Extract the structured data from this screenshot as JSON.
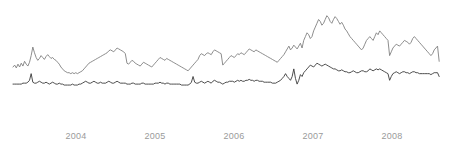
{
  "chart_data": {
    "type": "line",
    "title": "",
    "subtitle": "",
    "xlabel": "",
    "ylabel": "",
    "grid": false,
    "legend": "none",
    "axis_visible": false,
    "xlim": [
      2003.45,
      2008.62
    ],
    "ylim": [
      0,
      100
    ],
    "tick_labels": [
      "2004",
      "2005",
      "2006",
      "2007",
      "2008"
    ],
    "tick_values": [
      2004,
      2005,
      2006,
      2007,
      2008
    ],
    "tick_color": "#9a9a9a",
    "series": [
      {
        "name": "upper-series",
        "color": "#808080",
        "stroke_width": 0.9,
        "x": [
          2003.45,
          2003.47,
          2003.49,
          2003.51,
          2003.53,
          2003.55,
          2003.57,
          2003.59,
          2003.61,
          2003.63,
          2003.65,
          2003.67,
          2003.69,
          2003.71,
          2003.73,
          2003.75,
          2003.77,
          2003.79,
          2003.81,
          2003.83,
          2003.85,
          2003.87,
          2003.89,
          2003.91,
          2003.93,
          2003.95,
          2003.97,
          2003.99,
          2004.01,
          2004.03,
          2004.05,
          2004.07,
          2004.09,
          2004.11,
          2004.13,
          2004.15,
          2004.17,
          2004.19,
          2004.21,
          2004.23,
          2004.25,
          2004.27,
          2004.29,
          2004.31,
          2004.33,
          2004.35,
          2004.37,
          2004.39,
          2004.41,
          2004.43,
          2004.45,
          2004.47,
          2004.49,
          2004.51,
          2004.53,
          2004.55,
          2004.57,
          2004.59,
          2004.61,
          2004.63,
          2004.65,
          2004.67,
          2004.69,
          2004.71,
          2004.73,
          2004.75,
          2004.77,
          2004.79,
          2004.81,
          2004.83,
          2004.85,
          2004.87,
          2004.89,
          2004.91,
          2004.93,
          2004.95,
          2004.97,
          2004.99,
          2005.01,
          2005.03,
          2005.05,
          2005.07,
          2005.09,
          2005.11,
          2005.13,
          2005.15,
          2005.17,
          2005.19,
          2005.21,
          2005.23,
          2005.25,
          2005.27,
          2005.29,
          2005.31,
          2005.33,
          2005.35,
          2005.37,
          2005.39,
          2005.41,
          2005.43,
          2005.45,
          2005.47,
          2005.49,
          2005.51,
          2005.53,
          2005.55,
          2005.57,
          2005.59,
          2005.61,
          2005.63,
          2005.65,
          2005.67,
          2005.69,
          2005.71,
          2005.73,
          2005.75,
          2005.77,
          2005.79,
          2005.81,
          2005.83,
          2005.85,
          2005.87,
          2005.89,
          2005.91,
          2005.93,
          2005.95,
          2005.97,
          2005.99,
          2006.01,
          2006.03,
          2006.05,
          2006.07,
          2006.09,
          2006.11,
          2006.13,
          2006.15,
          2006.17,
          2006.19,
          2006.21,
          2006.23,
          2006.25,
          2006.27,
          2006.29,
          2006.31,
          2006.33,
          2006.35,
          2006.37,
          2006.39,
          2006.41,
          2006.43,
          2006.45,
          2006.47,
          2006.49,
          2006.51,
          2006.53,
          2006.55,
          2006.57,
          2006.59,
          2006.61,
          2006.63,
          2006.65,
          2006.67,
          2006.69,
          2006.71,
          2006.73,
          2006.75,
          2006.77,
          2006.79,
          2006.81,
          2006.83,
          2006.85,
          2006.87,
          2006.89,
          2006.91,
          2006.93,
          2006.95,
          2006.97,
          2006.99,
          2007.01,
          2007.03,
          2007.05,
          2007.07,
          2007.09,
          2007.11,
          2007.13,
          2007.15,
          2007.17,
          2007.19,
          2007.21,
          2007.23,
          2007.25,
          2007.27,
          2007.29,
          2007.31,
          2007.33,
          2007.35,
          2007.37,
          2007.39,
          2007.41,
          2007.43,
          2007.45,
          2007.47,
          2007.49,
          2007.51,
          2007.53,
          2007.55,
          2007.57,
          2007.59,
          2007.61,
          2007.63,
          2007.65,
          2007.67,
          2007.69,
          2007.71,
          2007.73,
          2007.75,
          2007.77,
          2007.79,
          2007.81,
          2007.83,
          2007.85,
          2007.87,
          2007.89,
          2007.91,
          2007.93,
          2007.95,
          2007.97,
          2007.99,
          2008.01,
          2008.03,
          2008.05,
          2008.07,
          2008.09,
          2008.11,
          2008.13,
          2008.15,
          2008.17,
          2008.19,
          2008.21,
          2008.23,
          2008.25,
          2008.27,
          2008.29,
          2008.31,
          2008.33,
          2008.35,
          2008.37,
          2008.39,
          2008.41,
          2008.43,
          2008.45,
          2008.47,
          2008.49,
          2008.51,
          2008.53,
          2008.55,
          2008.57,
          2008.59,
          2008.61
        ],
        "values": [
          40,
          42,
          39,
          43,
          40,
          44,
          41,
          46,
          43,
          41,
          45,
          52,
          61,
          55,
          50,
          47,
          49,
          52,
          50,
          48,
          51,
          53,
          51,
          49,
          50,
          48,
          47,
          45,
          43,
          40,
          38,
          36,
          35,
          34,
          34,
          33,
          34,
          33,
          34,
          33,
          34,
          35,
          36,
          38,
          40,
          42,
          44,
          45,
          46,
          47,
          48,
          49,
          50,
          51,
          52,
          53,
          54,
          55,
          57,
          58,
          57,
          56,
          58,
          60,
          59,
          58,
          57,
          56,
          54,
          44,
          43,
          45,
          47,
          46,
          44,
          43,
          42,
          41,
          43,
          45,
          44,
          43,
          42,
          41,
          40,
          42,
          44,
          46,
          48,
          50,
          49,
          48,
          47,
          49,
          48,
          47,
          46,
          45,
          44,
          43,
          42,
          41,
          40,
          39,
          38,
          37,
          36,
          38,
          40,
          42,
          44,
          46,
          48,
          52,
          54,
          53,
          52,
          54,
          55,
          54,
          53,
          56,
          58,
          57,
          56,
          55,
          54,
          42,
          44,
          46,
          48,
          50,
          52,
          51,
          50,
          52,
          54,
          53,
          55,
          54,
          53,
          55,
          57,
          59,
          58,
          57,
          56,
          58,
          57,
          56,
          55,
          54,
          53,
          52,
          51,
          50,
          49,
          48,
          47,
          46,
          45,
          47,
          49,
          51,
          53,
          56,
          59,
          62,
          58,
          60,
          63,
          61,
          59,
          62,
          65,
          60,
          68,
          72,
          76,
          74,
          70,
          72,
          78,
          82,
          86,
          90,
          88,
          84,
          86,
          90,
          94,
          92,
          88,
          86,
          90,
          93,
          91,
          88,
          85,
          87,
          84,
          80,
          78,
          75,
          72,
          70,
          68,
          66,
          64,
          62,
          60,
          58,
          60,
          64,
          68,
          70,
          72,
          70,
          68,
          72,
          76,
          74,
          78,
          76,
          74,
          72,
          70,
          68,
          52,
          56,
          60,
          62,
          64,
          63,
          62,
          64,
          66,
          68,
          67,
          66,
          64,
          66,
          70,
          72,
          70,
          68,
          66,
          64,
          62,
          60,
          58,
          56,
          54,
          52,
          54,
          58,
          60,
          62,
          46
        ]
      },
      {
        "name": "lower-series",
        "color": "#3a3a3a",
        "stroke_width": 0.9,
        "x": [
          2003.45,
          2003.47,
          2003.49,
          2003.51,
          2003.53,
          2003.55,
          2003.57,
          2003.59,
          2003.61,
          2003.63,
          2003.65,
          2003.67,
          2003.69,
          2003.71,
          2003.73,
          2003.75,
          2003.77,
          2003.79,
          2003.81,
          2003.83,
          2003.85,
          2003.87,
          2003.89,
          2003.91,
          2003.93,
          2003.95,
          2003.97,
          2003.99,
          2004.01,
          2004.03,
          2004.05,
          2004.07,
          2004.09,
          2004.11,
          2004.13,
          2004.15,
          2004.17,
          2004.19,
          2004.21,
          2004.23,
          2004.25,
          2004.27,
          2004.29,
          2004.31,
          2004.33,
          2004.35,
          2004.37,
          2004.39,
          2004.41,
          2004.43,
          2004.45,
          2004.47,
          2004.49,
          2004.51,
          2004.53,
          2004.55,
          2004.57,
          2004.59,
          2004.61,
          2004.63,
          2004.65,
          2004.67,
          2004.69,
          2004.71,
          2004.73,
          2004.75,
          2004.77,
          2004.79,
          2004.81,
          2004.83,
          2004.85,
          2004.87,
          2004.89,
          2004.91,
          2004.93,
          2004.95,
          2004.97,
          2004.99,
          2005.01,
          2005.03,
          2005.05,
          2005.07,
          2005.09,
          2005.11,
          2005.13,
          2005.15,
          2005.17,
          2005.19,
          2005.21,
          2005.23,
          2005.25,
          2005.27,
          2005.29,
          2005.31,
          2005.33,
          2005.35,
          2005.37,
          2005.39,
          2005.41,
          2005.43,
          2005.45,
          2005.47,
          2005.49,
          2005.51,
          2005.53,
          2005.55,
          2005.57,
          2005.59,
          2005.61,
          2005.63,
          2005.65,
          2005.67,
          2005.69,
          2005.71,
          2005.73,
          2005.75,
          2005.77,
          2005.79,
          2005.81,
          2005.83,
          2005.85,
          2005.87,
          2005.89,
          2005.91,
          2005.93,
          2005.95,
          2005.97,
          2005.99,
          2006.01,
          2006.03,
          2006.05,
          2006.07,
          2006.09,
          2006.11,
          2006.13,
          2006.15,
          2006.17,
          2006.19,
          2006.21,
          2006.23,
          2006.25,
          2006.27,
          2006.29,
          2006.31,
          2006.33,
          2006.35,
          2006.37,
          2006.39,
          2006.41,
          2006.43,
          2006.45,
          2006.47,
          2006.49,
          2006.51,
          2006.53,
          2006.55,
          2006.57,
          2006.59,
          2006.61,
          2006.63,
          2006.65,
          2006.67,
          2006.69,
          2006.71,
          2006.73,
          2006.75,
          2006.77,
          2006.79,
          2006.81,
          2006.83,
          2006.85,
          2006.87,
          2006.89,
          2006.91,
          2006.93,
          2006.95,
          2006.97,
          2006.99,
          2007.01,
          2007.03,
          2007.05,
          2007.07,
          2007.09,
          2007.11,
          2007.13,
          2007.15,
          2007.17,
          2007.19,
          2007.21,
          2007.23,
          2007.25,
          2007.27,
          2007.29,
          2007.31,
          2007.33,
          2007.35,
          2007.37,
          2007.39,
          2007.41,
          2007.43,
          2007.45,
          2007.47,
          2007.49,
          2007.51,
          2007.53,
          2007.55,
          2007.57,
          2007.59,
          2007.61,
          2007.63,
          2007.65,
          2007.67,
          2007.69,
          2007.71,
          2007.73,
          2007.75,
          2007.77,
          2007.79,
          2007.81,
          2007.83,
          2007.85,
          2007.87,
          2007.89,
          2007.91,
          2007.93,
          2007.95,
          2007.97,
          2007.99,
          2008.01,
          2008.03,
          2008.05,
          2008.07,
          2008.09,
          2008.11,
          2008.13,
          2008.15,
          2008.17,
          2008.19,
          2008.21,
          2008.23,
          2008.25,
          2008.27,
          2008.29,
          2008.31,
          2008.33,
          2008.35,
          2008.37,
          2008.39,
          2008.41,
          2008.43,
          2008.45,
          2008.47,
          2008.49,
          2008.51,
          2008.53,
          2008.55,
          2008.57,
          2008.59,
          2008.61
        ],
        "values": [
          22,
          22,
          22,
          22,
          22,
          22,
          23,
          23,
          23,
          24,
          26,
          33,
          24,
          23,
          23,
          24,
          25,
          24,
          23,
          23,
          24,
          23,
          22,
          23,
          24,
          23,
          22,
          22,
          23,
          22,
          22,
          21,
          21,
          21,
          21,
          21,
          22,
          21,
          21,
          21,
          22,
          22,
          23,
          24,
          25,
          24,
          23,
          23,
          24,
          25,
          24,
          23,
          23,
          24,
          23,
          23,
          23,
          24,
          25,
          24,
          23,
          23,
          24,
          25,
          24,
          23,
          23,
          23,
          23,
          22,
          22,
          22,
          23,
          23,
          22,
          22,
          22,
          22,
          23,
          23,
          22,
          22,
          22,
          22,
          22,
          22,
          23,
          23,
          23,
          24,
          23,
          23,
          22,
          23,
          23,
          22,
          22,
          22,
          22,
          22,
          22,
          22,
          21,
          21,
          21,
          21,
          21,
          22,
          24,
          30,
          24,
          23,
          23,
          24,
          25,
          24,
          23,
          24,
          25,
          24,
          23,
          25,
          26,
          25,
          24,
          24,
          23,
          22,
          23,
          24,
          24,
          25,
          25,
          25,
          24,
          25,
          26,
          25,
          26,
          25,
          25,
          26,
          26,
          27,
          26,
          26,
          25,
          26,
          26,
          25,
          25,
          25,
          24,
          24,
          24,
          24,
          24,
          23,
          23,
          23,
          24,
          25,
          26,
          28,
          30,
          33,
          30,
          28,
          26,
          30,
          38,
          28,
          22,
          26,
          32,
          30,
          34,
          36,
          38,
          40,
          42,
          41,
          40,
          42,
          44,
          43,
          42,
          41,
          42,
          43,
          42,
          41,
          40,
          39,
          38,
          38,
          37,
          36,
          36,
          37,
          36,
          35,
          35,
          34,
          34,
          35,
          36,
          35,
          34,
          34,
          35,
          36,
          36,
          35,
          35,
          36,
          38,
          37,
          36,
          37,
          38,
          37,
          38,
          37,
          36,
          35,
          34,
          33,
          26,
          30,
          33,
          34,
          35,
          34,
          33,
          34,
          35,
          35,
          34,
          34,
          33,
          34,
          35,
          35,
          34,
          34,
          33,
          33,
          33,
          33,
          33,
          33,
          33,
          32,
          33,
          34,
          34,
          34,
          30
        ]
      }
    ]
  },
  "axis": {
    "ticks": [
      {
        "label": "2004",
        "x_px": 76
      },
      {
        "label": "2005",
        "x_px": 155
      },
      {
        "label": "2006",
        "x_px": 234
      },
      {
        "label": "2007",
        "x_px": 313
      },
      {
        "label": "2008",
        "x_px": 392
      }
    ]
  },
  "colors": {
    "background": "#ffffff",
    "upper_series": "#808080",
    "lower_series": "#3a3a3a",
    "tick_text": "#9a9a9a"
  }
}
